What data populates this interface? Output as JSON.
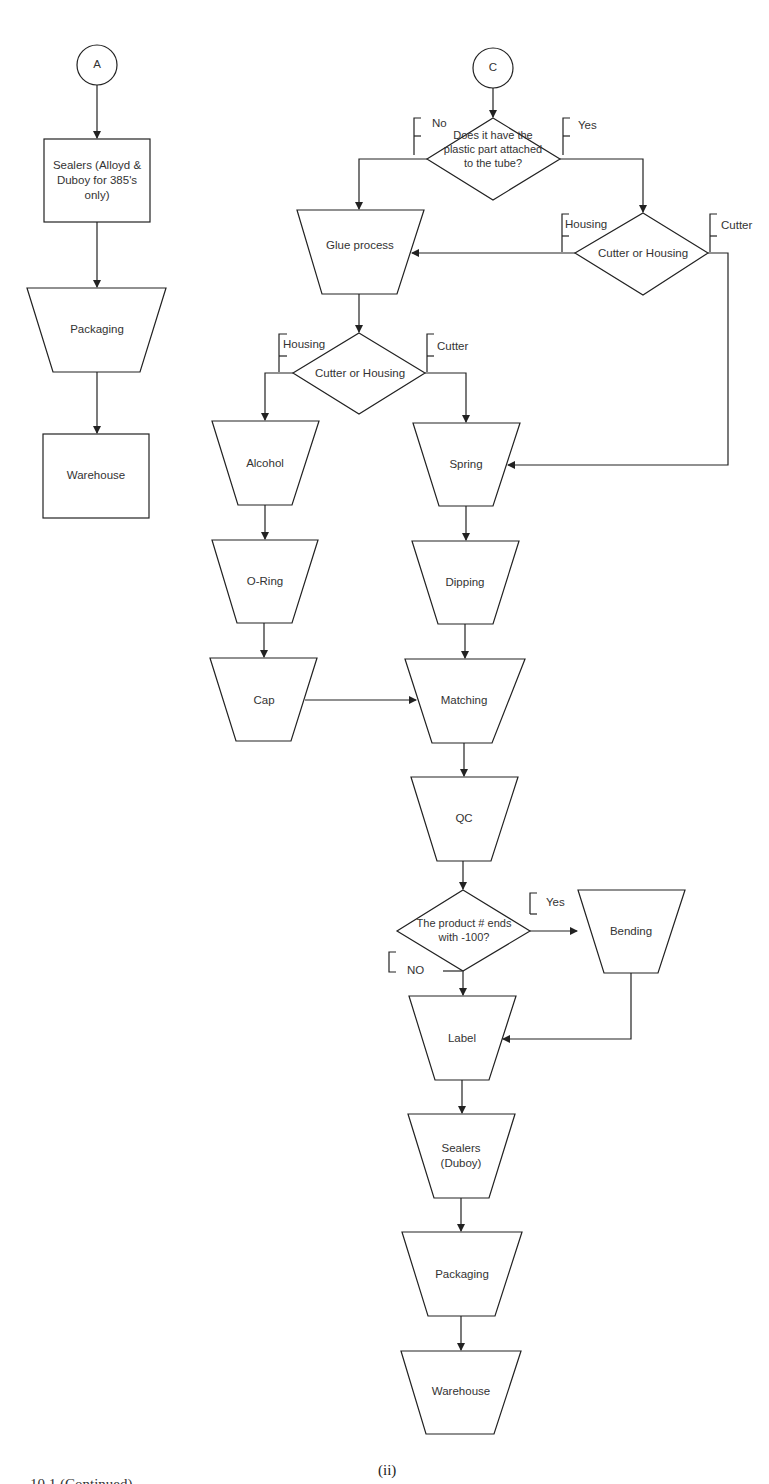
{
  "figure": {
    "sublabel": "(ii)",
    "caption_clipped": "10.1 (Continued)"
  },
  "colors": {
    "stroke": "#222222",
    "text": "#333333",
    "background": "#ffffff"
  },
  "left_flow": {
    "connector": "A",
    "nodes": [
      {
        "id": "sealers-alloyd-duboy",
        "shape": "rectangle",
        "label": "Sealers (Alloyd & Duboy for 385's only)"
      },
      {
        "id": "packaging-left",
        "shape": "trapezoid",
        "label": "Packaging"
      },
      {
        "id": "warehouse-left",
        "shape": "rectangle",
        "label": "Warehouse"
      }
    ]
  },
  "right_flow": {
    "connector": "C",
    "decisions": {
      "plastic_part": {
        "label": "Does it have the plastic part attached to the tube?",
        "no": "No",
        "yes": "Yes"
      },
      "cutter_housing_1": {
        "label": "Cutter or Housing",
        "housing": "Housing",
        "cutter": "Cutter"
      },
      "cutter_housing_2": {
        "label": "Cutter or Housing",
        "housing": "Housing",
        "cutter": "Cutter"
      },
      "product_100": {
        "label": "The product # ends with -100?",
        "yes": "Yes",
        "no": "NO"
      }
    },
    "nodes": {
      "glue": "Glue process",
      "alcohol": "Alcohol",
      "oring": "O-Ring",
      "cap": "Cap",
      "spring": "Spring",
      "dipping": "Dipping",
      "matching": "Matching",
      "qc": "QC",
      "bending": "Bending",
      "label": "Label",
      "sealers_duboy": "Sealers (Duboy)",
      "packaging": "Packaging",
      "warehouse": "Warehouse"
    }
  }
}
